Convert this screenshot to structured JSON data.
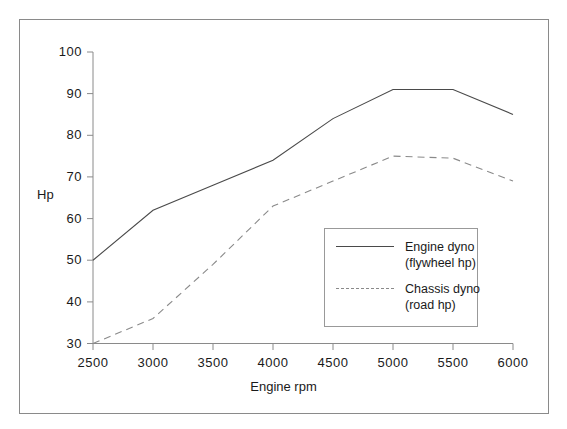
{
  "chart_data": {
    "type": "line",
    "title": "",
    "xlabel": "Engine rpm",
    "ylabel": "Hp",
    "x": [
      2500,
      3000,
      3500,
      4000,
      4500,
      5000,
      5500,
      6000
    ],
    "xlim": [
      2500,
      6000
    ],
    "ylim": [
      30,
      100
    ],
    "xticks": [
      "2500",
      "3000",
      "3500",
      "4000",
      "4500",
      "5000",
      "5500",
      "6000"
    ],
    "yticks": [
      "30",
      "40",
      "50",
      "60",
      "70",
      "80",
      "90",
      "100"
    ],
    "grid": false,
    "legend_position": "lower-right-inside",
    "series": [
      {
        "name": "Engine dyno (flywheel hp)",
        "label_line1": "Engine dyno",
        "label_line2": "(flywheel  hp)",
        "style": "solid",
        "color": "#4a4a4a",
        "values": [
          50,
          62,
          68,
          74,
          84,
          91,
          91,
          85
        ]
      },
      {
        "name": "Chassis dyno (road hp)",
        "label_line1": "Chassis dyno",
        "label_line2": "(road  hp)",
        "style": "dashed",
        "color": "#8a8a8a",
        "values": [
          30,
          36,
          49,
          63,
          69,
          75,
          74.5,
          69
        ]
      }
    ]
  },
  "axes": {
    "y_title": "Hp",
    "x_title": "Engine rpm"
  }
}
